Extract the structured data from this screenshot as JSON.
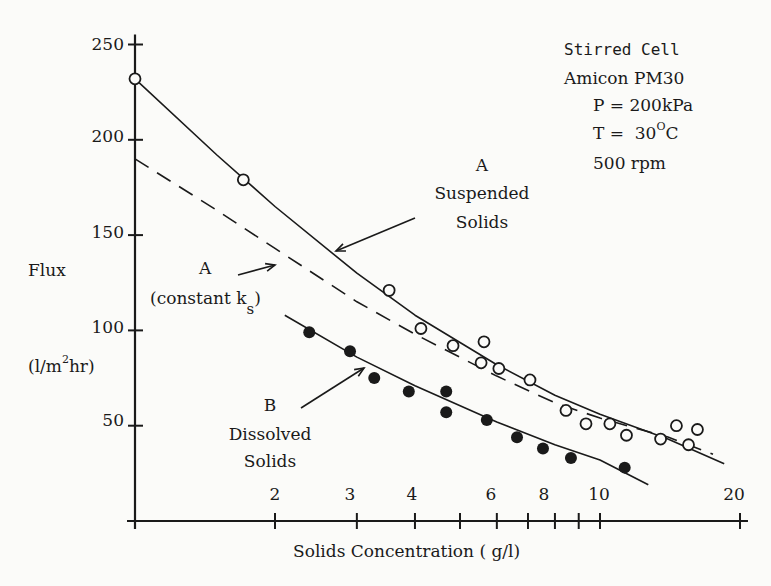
{
  "chart_data": {
    "type": "scatter",
    "title": "",
    "xlabel": "Solids Concentration ( g/l)",
    "ylabel": "Flux (l/m^2 hr)",
    "ylabel_parts": {
      "main": "Flux",
      "unit_prefix": "(l/m",
      "unit_sup": "2",
      "unit_suffix": "hr)"
    },
    "xscale": "log",
    "xlim": [
      1,
      20
    ],
    "ylim": [
      0,
      250
    ],
    "grid": false,
    "x_ticks": [
      1,
      2,
      3,
      4,
      5,
      6,
      7,
      8,
      9,
      10,
      20
    ],
    "x_tick_labels": [
      {
        "value": 2,
        "label": "2"
      },
      {
        "value": 3,
        "label": "3"
      },
      {
        "value": 4,
        "label": "4"
      },
      {
        "value": 6,
        "label": "6"
      },
      {
        "value": 8,
        "label": "8"
      },
      {
        "value": 10,
        "label": "10"
      },
      {
        "value": 20,
        "label": "20"
      }
    ],
    "y_tick_labels": [
      {
        "value": 50,
        "label": "50"
      },
      {
        "value": 100,
        "label": "100"
      },
      {
        "value": 150,
        "label": "150"
      },
      {
        "value": 200,
        "label": "200"
      },
      {
        "value": 250,
        "label": "250"
      }
    ],
    "conditions": {
      "line1": "Stirred Cell",
      "line2": "Amicon PM30",
      "line3": "P = 200kPa",
      "line4_prefix": "T =  30",
      "line4_sup": "O",
      "line4_suffix": "C",
      "line5": "500 rpm"
    },
    "annotations": {
      "suspended": {
        "line1": "A",
        "line2": "Suspended",
        "line3": "Solids"
      },
      "constant_k": {
        "line1": "A",
        "line2": "(constant k",
        "sub": "s",
        "close": ")"
      },
      "dissolved": {
        "line1": "B",
        "line2": "Dissolved",
        "line3": "Solids"
      }
    },
    "series": [
      {
        "name": "A Suspended Solids (data)",
        "marker": "open-circle",
        "points": [
          [
            1.0,
            232
          ],
          [
            1.71,
            179
          ],
          [
            3.52,
            121
          ],
          [
            4.12,
            101
          ],
          [
            4.83,
            92
          ],
          [
            5.63,
            94
          ],
          [
            5.55,
            83
          ],
          [
            6.06,
            80
          ],
          [
            7.07,
            74
          ],
          [
            8.45,
            58
          ],
          [
            9.33,
            51
          ],
          [
            10.5,
            51
          ],
          [
            11.4,
            45
          ],
          [
            13.5,
            43
          ],
          [
            14.6,
            50
          ],
          [
            16.2,
            48
          ],
          [
            15.5,
            40
          ]
        ]
      },
      {
        "name": "B Dissolved Solids (data)",
        "marker": "filled-circle",
        "points": [
          [
            2.37,
            99
          ],
          [
            2.9,
            89
          ],
          [
            3.27,
            75
          ],
          [
            3.88,
            68
          ],
          [
            4.67,
            68
          ],
          [
            4.67,
            57
          ],
          [
            5.71,
            53
          ],
          [
            6.63,
            44
          ],
          [
            7.54,
            38
          ],
          [
            8.66,
            33
          ],
          [
            11.3,
            28
          ]
        ]
      },
      {
        "name": "A Suspended Solids (model fit)",
        "style": "solid",
        "points": [
          [
            1.0,
            232
          ],
          [
            1.5,
            192
          ],
          [
            2.0,
            165
          ],
          [
            3.0,
            130
          ],
          [
            4.0,
            108
          ],
          [
            6.0,
            82
          ],
          [
            8.0,
            66
          ],
          [
            10.0,
            56
          ],
          [
            14.0,
            43
          ],
          [
            18.5,
            30
          ]
        ]
      },
      {
        "name": "A constant k_s (model)",
        "style": "dashed",
        "points": [
          [
            1.0,
            190
          ],
          [
            1.5,
            163
          ],
          [
            2.0,
            143
          ],
          [
            3.0,
            115
          ],
          [
            4.0,
            98
          ],
          [
            6.0,
            76
          ],
          [
            8.0,
            62
          ],
          [
            10.0,
            54
          ],
          [
            14.0,
            44
          ],
          [
            17.5,
            35
          ]
        ]
      },
      {
        "name": "B Dissolved Solids (model fit)",
        "style": "solid",
        "points": [
          [
            2.1,
            108
          ],
          [
            3.0,
            86
          ],
          [
            4.0,
            71
          ],
          [
            6.0,
            52
          ],
          [
            8.0,
            40
          ],
          [
            10.0,
            32
          ],
          [
            12.7,
            19
          ]
        ]
      }
    ]
  }
}
